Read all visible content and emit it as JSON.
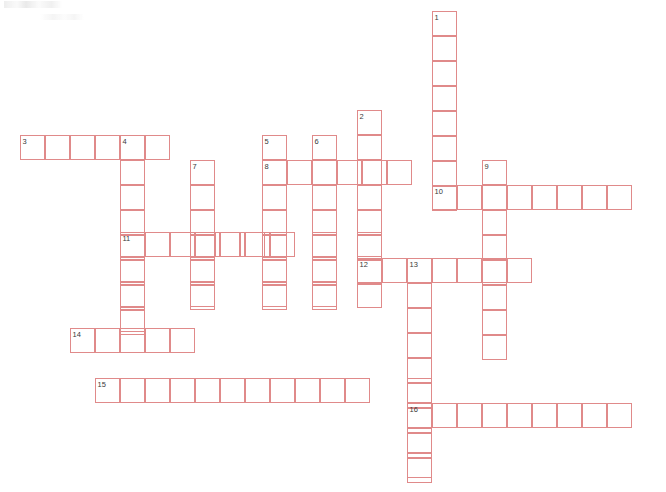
{
  "page": {
    "width": 666,
    "height": 492,
    "background_color": "#ffffff",
    "grid_line_color": "#e08a8a",
    "number_color": "#3a3a3a",
    "cell_size": 25
  },
  "puzzle": {
    "kind": "crossword-grid",
    "state": "empty",
    "total_entries": 16,
    "entries": [
      {
        "number": "1",
        "direction": "down",
        "col": 0,
        "row": 0,
        "length": 8,
        "x": 432,
        "y": 11
      },
      {
        "number": "2",
        "direction": "down",
        "col": 0,
        "row": 0,
        "length": 7,
        "x": 357,
        "y": 110
      },
      {
        "number": "3",
        "direction": "across",
        "col": 0,
        "row": 0,
        "length": 6,
        "x": 20,
        "y": 135
      },
      {
        "number": "4",
        "direction": "down",
        "col": 0,
        "row": 0,
        "length": 8,
        "x": 120,
        "y": 135
      },
      {
        "number": "5",
        "direction": "down",
        "col": 0,
        "row": 0,
        "length": 7,
        "x": 262,
        "y": 135
      },
      {
        "number": "6",
        "direction": "down",
        "col": 0,
        "row": 0,
        "length": 7,
        "x": 312,
        "y": 135
      },
      {
        "number": "7",
        "direction": "down",
        "col": 0,
        "row": 0,
        "length": 6,
        "x": 190,
        "y": 160
      },
      {
        "number": "8",
        "direction": "across",
        "col": 0,
        "row": 0,
        "length": 6,
        "x": 262,
        "y": 160
      },
      {
        "number": "9",
        "direction": "down",
        "col": 0,
        "row": 0,
        "length": 6,
        "x": 482,
        "y": 160
      },
      {
        "number": "10",
        "direction": "across",
        "col": 0,
        "row": 0,
        "length": 8,
        "x": 432,
        "y": 185
      },
      {
        "number": "11",
        "direction": "across",
        "col": 0,
        "row": 0,
        "length": 7,
        "x": 120,
        "y": 232
      },
      {
        "number": "12",
        "direction": "across",
        "col": 0,
        "row": 0,
        "length": 7,
        "x": 357,
        "y": 258
      },
      {
        "number": "13",
        "direction": "down",
        "col": 0,
        "row": 0,
        "length": 9,
        "x": 407,
        "y": 258
      },
      {
        "number": "14",
        "direction": "across",
        "col": 0,
        "row": 0,
        "length": 5,
        "x": 70,
        "y": 328
      },
      {
        "number": "15",
        "direction": "across",
        "col": 0,
        "row": 0,
        "length": 11,
        "x": 95,
        "y": 378
      },
      {
        "number": "16",
        "direction": "across",
        "col": 0,
        "row": 0,
        "length": 9,
        "x": 407,
        "y": 403
      }
    ],
    "cells": [
      {
        "x": 20,
        "y": 135,
        "value": ""
      },
      {
        "x": 45,
        "y": 135,
        "value": ""
      },
      {
        "x": 70,
        "y": 135,
        "value": ""
      },
      {
        "x": 95,
        "y": 135,
        "value": ""
      },
      {
        "x": 120,
        "y": 135,
        "value": ""
      },
      {
        "x": 145,
        "y": 135,
        "value": ""
      },
      {
        "x": 120,
        "y": 160,
        "value": ""
      },
      {
        "x": 120,
        "y": 185,
        "value": ""
      },
      {
        "x": 120,
        "y": 210,
        "value": ""
      },
      {
        "x": 120,
        "y": 232,
        "value": ""
      },
      {
        "x": 120,
        "y": 257,
        "value": ""
      },
      {
        "x": 120,
        "y": 282,
        "value": ""
      },
      {
        "x": 120,
        "y": 307,
        "value": ""
      },
      {
        "x": 190,
        "y": 160,
        "value": ""
      },
      {
        "x": 190,
        "y": 185,
        "value": ""
      },
      {
        "x": 190,
        "y": 210,
        "value": ""
      },
      {
        "x": 190,
        "y": 232,
        "value": ""
      },
      {
        "x": 190,
        "y": 257,
        "value": ""
      },
      {
        "x": 190,
        "y": 282,
        "value": ""
      },
      {
        "x": 262,
        "y": 135,
        "value": ""
      },
      {
        "x": 262,
        "y": 160,
        "value": ""
      },
      {
        "x": 262,
        "y": 185,
        "value": ""
      },
      {
        "x": 262,
        "y": 210,
        "value": ""
      },
      {
        "x": 262,
        "y": 232,
        "value": ""
      },
      {
        "x": 262,
        "y": 257,
        "value": ""
      },
      {
        "x": 262,
        "y": 282,
        "value": ""
      },
      {
        "x": 312,
        "y": 135,
        "value": ""
      },
      {
        "x": 312,
        "y": 160,
        "value": ""
      },
      {
        "x": 312,
        "y": 185,
        "value": ""
      },
      {
        "x": 312,
        "y": 210,
        "value": ""
      },
      {
        "x": 312,
        "y": 232,
        "value": ""
      },
      {
        "x": 312,
        "y": 257,
        "value": ""
      },
      {
        "x": 312,
        "y": 282,
        "value": ""
      },
      {
        "x": 287,
        "y": 160,
        "value": ""
      },
      {
        "x": 337,
        "y": 160,
        "value": ""
      },
      {
        "x": 362,
        "y": 160,
        "value": ""
      },
      {
        "x": 387,
        "y": 160,
        "value": ""
      },
      {
        "x": 357,
        "y": 110,
        "value": ""
      },
      {
        "x": 357,
        "y": 135,
        "value": ""
      },
      {
        "x": 357,
        "y": 185,
        "value": ""
      },
      {
        "x": 357,
        "y": 210,
        "value": ""
      },
      {
        "x": 357,
        "y": 232,
        "value": ""
      },
      {
        "x": 357,
        "y": 258,
        "value": ""
      },
      {
        "x": 357,
        "y": 283,
        "value": ""
      },
      {
        "x": 432,
        "y": 11,
        "value": ""
      },
      {
        "x": 432,
        "y": 36,
        "value": ""
      },
      {
        "x": 432,
        "y": 61,
        "value": ""
      },
      {
        "x": 432,
        "y": 86,
        "value": ""
      },
      {
        "x": 432,
        "y": 111,
        "value": ""
      },
      {
        "x": 432,
        "y": 136,
        "value": ""
      },
      {
        "x": 432,
        "y": 161,
        "value": ""
      },
      {
        "x": 432,
        "y": 185,
        "value": ""
      },
      {
        "x": 457,
        "y": 185,
        "value": ""
      },
      {
        "x": 482,
        "y": 185,
        "value": ""
      },
      {
        "x": 507,
        "y": 185,
        "value": ""
      },
      {
        "x": 532,
        "y": 185,
        "value": ""
      },
      {
        "x": 557,
        "y": 185,
        "value": ""
      },
      {
        "x": 582,
        "y": 185,
        "value": ""
      },
      {
        "x": 607,
        "y": 185,
        "value": ""
      },
      {
        "x": 482,
        "y": 160,
        "value": ""
      },
      {
        "x": 482,
        "y": 210,
        "value": ""
      },
      {
        "x": 482,
        "y": 235,
        "value": ""
      },
      {
        "x": 482,
        "y": 260,
        "value": ""
      },
      {
        "x": 482,
        "y": 285,
        "value": ""
      },
      {
        "x": 482,
        "y": 310,
        "value": ""
      },
      {
        "x": 482,
        "y": 335,
        "value": ""
      },
      {
        "x": 145,
        "y": 232,
        "value": ""
      },
      {
        "x": 170,
        "y": 232,
        "value": ""
      },
      {
        "x": 215,
        "y": 232,
        "value": ""
      },
      {
        "x": 240,
        "y": 232,
        "value": ""
      },
      {
        "x": 382,
        "y": 258,
        "value": ""
      },
      {
        "x": 407,
        "y": 258,
        "value": ""
      },
      {
        "x": 432,
        "y": 258,
        "value": ""
      },
      {
        "x": 457,
        "y": 258,
        "value": ""
      },
      {
        "x": 482,
        "y": 258,
        "value": ""
      },
      {
        "x": 507,
        "y": 258,
        "value": ""
      },
      {
        "x": 407,
        "y": 283,
        "value": ""
      },
      {
        "x": 407,
        "y": 308,
        "value": ""
      },
      {
        "x": 407,
        "y": 333,
        "value": ""
      },
      {
        "x": 407,
        "y": 358,
        "value": ""
      },
      {
        "x": 407,
        "y": 378,
        "value": ""
      },
      {
        "x": 407,
        "y": 403,
        "value": ""
      },
      {
        "x": 407,
        "y": 428,
        "value": ""
      },
      {
        "x": 407,
        "y": 453,
        "value": ""
      },
      {
        "x": 70,
        "y": 328,
        "value": ""
      },
      {
        "x": 95,
        "y": 328,
        "value": ""
      },
      {
        "x": 145,
        "y": 328,
        "value": ""
      },
      {
        "x": 170,
        "y": 328,
        "value": ""
      },
      {
        "x": 95,
        "y": 378,
        "value": ""
      },
      {
        "x": 145,
        "y": 378,
        "value": ""
      },
      {
        "x": 170,
        "y": 378,
        "value": ""
      },
      {
        "x": 195,
        "y": 378,
        "value": ""
      },
      {
        "x": 220,
        "y": 378,
        "value": ""
      },
      {
        "x": 245,
        "y": 378,
        "value": ""
      },
      {
        "x": 270,
        "y": 378,
        "value": ""
      },
      {
        "x": 295,
        "y": 378,
        "value": ""
      },
      {
        "x": 320,
        "y": 378,
        "value": ""
      },
      {
        "x": 345,
        "y": 378,
        "value": ""
      },
      {
        "x": 432,
        "y": 403,
        "value": ""
      },
      {
        "x": 457,
        "y": 403,
        "value": ""
      },
      {
        "x": 482,
        "y": 403,
        "value": ""
      },
      {
        "x": 507,
        "y": 403,
        "value": ""
      },
      {
        "x": 532,
        "y": 403,
        "value": ""
      },
      {
        "x": 557,
        "y": 403,
        "value": ""
      },
      {
        "x": 582,
        "y": 403,
        "value": ""
      },
      {
        "x": 607,
        "y": 403,
        "value": ""
      }
    ]
  }
}
